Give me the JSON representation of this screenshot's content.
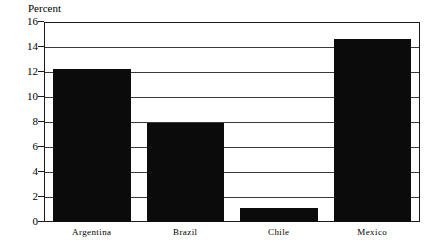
{
  "chart_data": {
    "type": "bar",
    "title": "",
    "subtitle": "",
    "xlabel": "",
    "ylabel": "Percent",
    "ylim": [
      0,
      16
    ],
    "ytick_step": 2,
    "yticks": [
      16,
      14,
      12,
      10,
      8,
      6,
      4,
      2,
      0
    ],
    "grid": true,
    "legend": "none",
    "categories": [
      "Argentina",
      "Brazil",
      "Chile",
      "Mexico"
    ],
    "values": [
      12.3,
      8.0,
      1.1,
      14.7
    ],
    "bars": [
      {
        "category": "Argentina",
        "value": 12.3
      },
      {
        "category": "Brazil",
        "value": 8.0
      },
      {
        "category": "Chile",
        "value": 1.1
      },
      {
        "category": "Mexico",
        "value": 14.7
      }
    ],
    "colors": {
      "bar_fill": "#0b0b0b",
      "axis_line": "#1a1a1a",
      "gridline": "#3a3a3a",
      "background": "#ffffff"
    }
  }
}
